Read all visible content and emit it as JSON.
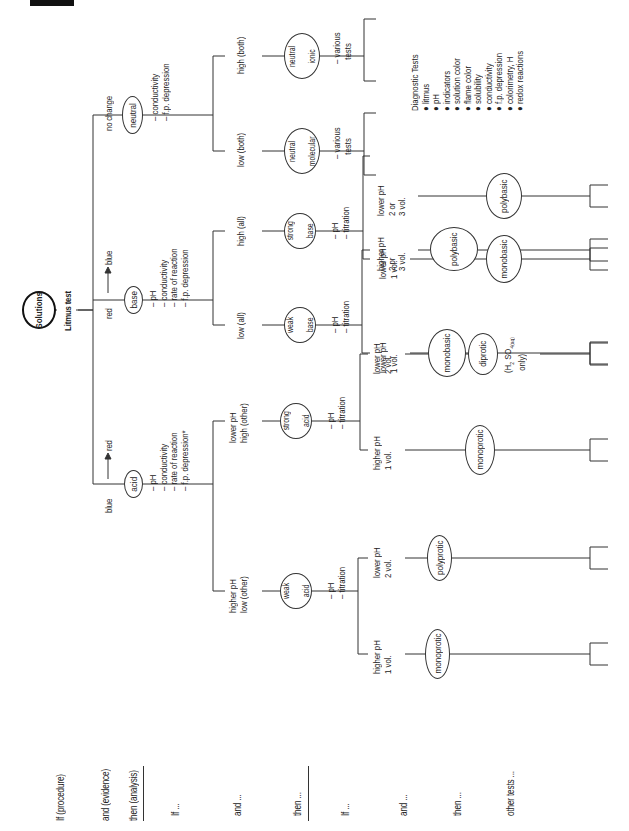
{
  "root": {
    "label": "Solutions",
    "test": "Litmus test"
  },
  "row_labels": {
    "if_procedure": "If (procedure)",
    "and_evidence": "and (evidence)",
    "then_analysis": "then (analysis)",
    "if_1": "If ...",
    "and_1": "and ...",
    "then_1": "then ...",
    "if_2": "If ...",
    "and_2": "and ...",
    "then_2": "then ...",
    "other_tests": "other tests ..."
  },
  "level1": {
    "acid": {
      "evidence": "blue",
      "arrow_to": "red",
      "label": "acid",
      "tests": [
        "pH",
        "conductivity",
        "rate of reaction",
        "f.p. depression*"
      ]
    },
    "base": {
      "evidence": "red",
      "arrow_to": "blue",
      "label": "base",
      "tests": [
        "pH",
        "conductivity",
        "rate of reaction",
        "f.p. depression"
      ]
    },
    "neutral": {
      "evidence": "no change",
      "label": "neutral",
      "tests": [
        "conductivity",
        "f.p. depression"
      ]
    }
  },
  "level2": {
    "weak_acid": {
      "condition": [
        "higher pH",
        "low (other)"
      ],
      "label": [
        "weak",
        "acid"
      ],
      "tests": [
        "pH",
        "titration"
      ]
    },
    "strong_acid": {
      "condition": [
        "lower pH",
        "high (other)"
      ],
      "label": [
        "strong",
        "acid"
      ],
      "tests": [
        "pH",
        "titration"
      ]
    },
    "weak_base": {
      "condition": [
        "low (all)"
      ],
      "label": [
        "weak",
        "base"
      ],
      "tests": [
        "pH",
        "titration"
      ]
    },
    "strong_base": {
      "condition": [
        "high (all)"
      ],
      "label": [
        "strong",
        "base"
      ],
      "tests": [
        "pH",
        "titration"
      ]
    },
    "neutral_molecular": {
      "condition": [
        "low (both)"
      ],
      "label": [
        "neutral",
        "molecular"
      ],
      "tests": [
        "various",
        "tests"
      ]
    },
    "neutral_ionic": {
      "condition": [
        "high (both)"
      ],
      "label": [
        "neutral",
        "ionic"
      ],
      "tests": [
        "various",
        "tests"
      ]
    }
  },
  "level3": [
    {
      "parent": "weak_acid",
      "condition": [
        "higher pH",
        "1 vol."
      ],
      "label": "monoprotic"
    },
    {
      "parent": "weak_acid",
      "condition": [
        "lower pH",
        "2 vol."
      ],
      "label": "polyprotic"
    },
    {
      "parent": "strong_acid",
      "condition": [
        "higher pH",
        "1 vol."
      ],
      "label": "monoprotic"
    },
    {
      "parent": "strong_acid",
      "condition": [
        "lower pH",
        "2 vol."
      ],
      "label": "diprotic",
      "note": [
        "(H",
        "2",
        "SO",
        "4(aq)",
        "only)"
      ]
    },
    {
      "parent": "weak_base",
      "condition": [
        "lower pH",
        "1 vol."
      ],
      "label": "monobasic"
    },
    {
      "parent": "weak_base",
      "condition": [
        "higher pH",
        "2 or",
        "3 vol."
      ],
      "label": "polybasic"
    },
    {
      "parent": "strong_base",
      "condition": [
        "lower pH",
        "1 vol."
      ],
      "label": "monobasic"
    },
    {
      "parent": "strong_base",
      "condition": [
        "lower pH",
        "2 or",
        "3 vol."
      ],
      "label": "polybasic"
    }
  ],
  "diagnostic_tests": {
    "title": "Diagnostic Tests",
    "items": [
      "litmus",
      "pH",
      "indicators",
      "solution color",
      "flame color",
      "solubility",
      "conductivity",
      "f.p. depression",
      "colorimetry, H",
      "redox reactions"
    ]
  },
  "colors": {
    "line": "#333333",
    "text": "#222222",
    "background": "#ffffff"
  }
}
